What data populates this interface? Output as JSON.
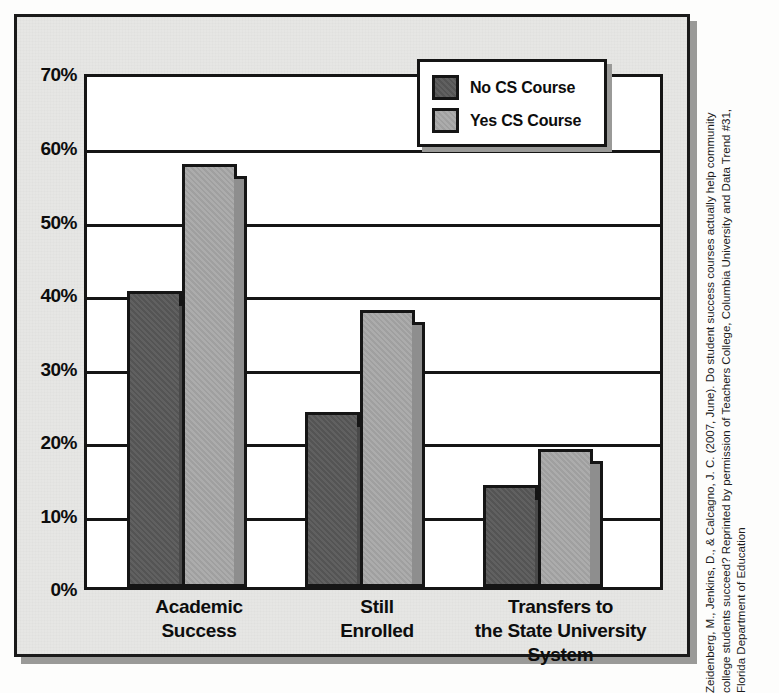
{
  "chart_data": {
    "type": "bar",
    "title": "",
    "xlabel": "",
    "ylabel": "",
    "ylim": [
      0,
      70
    ],
    "yticks": [
      "0%",
      "10%",
      "20%",
      "30%",
      "40%",
      "50%",
      "60%",
      "70%"
    ],
    "ytick_values": [
      0,
      10,
      20,
      30,
      40,
      50,
      60,
      70
    ],
    "grid": true,
    "legend_position": "upper-right",
    "categories": [
      "Academic Success",
      "Still Enrolled",
      "Transfers to the State University System"
    ],
    "category_label_lines": [
      [
        "Academic",
        "Success"
      ],
      [
        "Still",
        "Enrolled"
      ],
      [
        "Transfers to",
        "the State University",
        "System"
      ]
    ],
    "series": [
      {
        "name": "No CS Course",
        "color": "#585858",
        "values": [
          40.6,
          24.0,
          14.0
        ]
      },
      {
        "name": "Yes CS Course",
        "color": "#a8a8a8",
        "values": [
          58.0,
          38.0,
          19.0
        ]
      }
    ]
  },
  "legend": {
    "items": [
      {
        "label": "No CS Course",
        "color": "#585858"
      },
      {
        "label": "Yes CS Course",
        "color": "#a8a8a8"
      }
    ]
  },
  "citation": {
    "line1": "Zeidenberg, M., Jenkins, D., & Calcagno, J. C. (2007, June). Do student success courses actually help community",
    "line2": "college students succeed? Reprinted by permission of Teachers College, Columbia University and Data Trend #31,",
    "line3": "Florida Department of Education"
  }
}
